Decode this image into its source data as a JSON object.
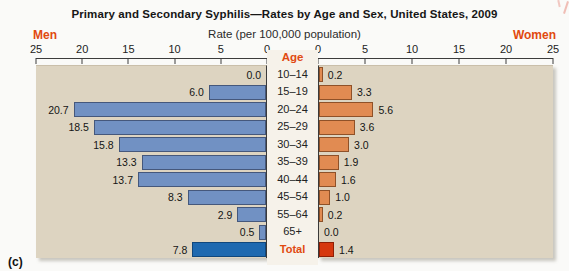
{
  "figure": {
    "title": "Primary and Secondary Syphilis—Rates by Age and Sex, United States, 2009",
    "subtitle": "Rate (per 100,000 population)",
    "men_header": "Men",
    "women_header": "Women",
    "age_header": "Age",
    "corner_label": "(c)"
  },
  "chart_data": {
    "type": "bar",
    "variant": "population-pyramid",
    "title": "Primary and Secondary Syphilis—Rates by Age and Sex, United States, 2009",
    "xlabel": "Rate (per 100,000 population)",
    "categories": [
      "10–14",
      "15–19",
      "20–24",
      "25–29",
      "30–34",
      "35–39",
      "40–44",
      "45–54",
      "55–64",
      "65+",
      "Total"
    ],
    "series": [
      {
        "name": "Men",
        "side": "left",
        "values": [
          0.0,
          6.0,
          20.7,
          18.5,
          15.8,
          13.3,
          13.7,
          8.3,
          2.9,
          0.5,
          7.8
        ]
      },
      {
        "name": "Women",
        "side": "right",
        "values": [
          0.2,
          3.3,
          5.6,
          3.6,
          3.0,
          1.9,
          1.6,
          1.0,
          0.2,
          0.0,
          1.4
        ]
      }
    ],
    "axis": {
      "max": 25,
      "left_ticks": [
        25,
        20,
        15,
        10,
        5,
        0
      ],
      "right_ticks": [
        0,
        5,
        10,
        15,
        20,
        25
      ]
    },
    "value_labels": true,
    "legend": "none",
    "grid": false
  },
  "colors": {
    "accent_text": "#e1490f",
    "panel_bg": "#ddd4c1",
    "age_col_bg": "#f6f2ea",
    "men_bar": "#7191c3",
    "men_bar_border": "#45587c",
    "men_total_bar": "#1e69b0",
    "men_total_border": "#10477c",
    "women_bar": "#e18b52",
    "women_bar_border": "#8f5128",
    "women_total_bar": "#d6380f",
    "women_total_border": "#8f1f06"
  }
}
